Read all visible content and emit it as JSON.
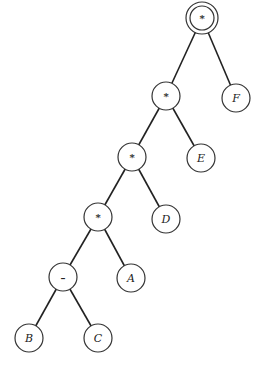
{
  "diagram": {
    "type": "expression-tree",
    "nodes": [
      {
        "id": "n1",
        "label": "*",
        "kind": "operator",
        "root": true,
        "x": 202,
        "y": 18
      },
      {
        "id": "n2",
        "label": "*",
        "kind": "operator",
        "x": 166,
        "y": 96
      },
      {
        "id": "n3",
        "label": "F",
        "kind": "operand",
        "x": 236,
        "y": 98
      },
      {
        "id": "n4",
        "label": "*",
        "kind": "operator",
        "x": 132,
        "y": 157
      },
      {
        "id": "n5",
        "label": "E",
        "kind": "operand",
        "x": 201,
        "y": 158
      },
      {
        "id": "n6",
        "label": "*",
        "kind": "operator",
        "x": 98,
        "y": 217
      },
      {
        "id": "n7",
        "label": "D",
        "kind": "operand",
        "x": 166,
        "y": 219
      },
      {
        "id": "n8",
        "label": "–",
        "kind": "operator",
        "x": 63,
        "y": 277
      },
      {
        "id": "n9",
        "label": "A",
        "kind": "operand",
        "x": 131,
        "y": 278
      },
      {
        "id": "n10",
        "label": "B",
        "kind": "operand",
        "x": 29,
        "y": 338
      },
      {
        "id": "n11",
        "label": "C",
        "kind": "operand",
        "x": 98,
        "y": 338
      }
    ],
    "edges": [
      [
        "n1",
        "n2"
      ],
      [
        "n1",
        "n3"
      ],
      [
        "n2",
        "n4"
      ],
      [
        "n2",
        "n5"
      ],
      [
        "n4",
        "n6"
      ],
      [
        "n4",
        "n7"
      ],
      [
        "n6",
        "n8"
      ],
      [
        "n6",
        "n9"
      ],
      [
        "n8",
        "n10"
      ],
      [
        "n8",
        "n11"
      ]
    ]
  }
}
